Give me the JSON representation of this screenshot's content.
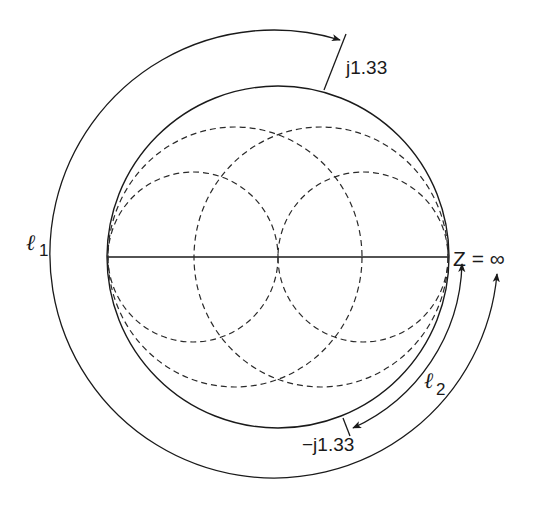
{
  "diagram": {
    "type": "smith-chart-figure",
    "center": [
      278,
      257
    ],
    "main_circle_radius": 171,
    "colors": {
      "stroke": "#1a1a1a",
      "background": "#ffffff"
    },
    "labels": {
      "top_mark": "j1.33",
      "bottom_mark": "−j1.33",
      "right_point": "Z = ∞",
      "l1_symbol": "ℓ",
      "l1_sub": "1",
      "l2_symbol": "ℓ",
      "l2_sub": "2"
    },
    "dashed_circles": [
      {
        "name": "small-left",
        "cx": 193,
        "r": 85
      },
      {
        "name": "small-right",
        "cx": 363,
        "r": 85
      },
      {
        "name": "large-left",
        "cx": 235,
        "r": 127
      },
      {
        "name": "large-right",
        "cx": 321,
        "r": 127
      }
    ],
    "arcs": [
      {
        "name": "l1-arc",
        "radius": 226,
        "from": "Z = ∞",
        "to": "j1.33",
        "arrows": "both"
      },
      {
        "name": "l2-arc",
        "radius": 187,
        "from": "Z = ∞",
        "to": "−j1.33",
        "arrows": "both"
      }
    ]
  }
}
